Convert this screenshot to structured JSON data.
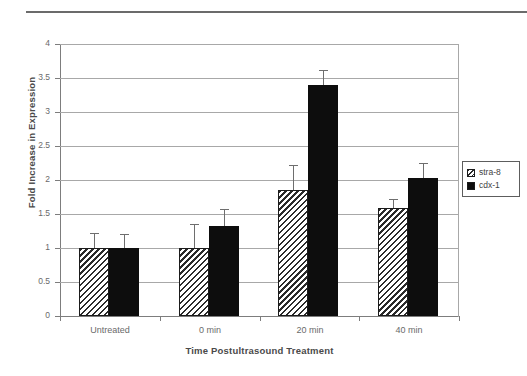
{
  "figure": {
    "has_top_rule": true
  },
  "chart_data": {
    "type": "bar",
    "title": "",
    "xlabel": "Time Postultrasound Treatment",
    "ylabel": "Fold Increase in Expression",
    "categories": [
      "Untreated",
      "0 min",
      "20 min",
      "40 min"
    ],
    "ylim": [
      0,
      4
    ],
    "yticks": [
      0,
      0.5,
      1,
      1.5,
      2,
      2.5,
      3,
      3.5,
      4
    ],
    "ytick_labels": [
      "0",
      "0.5",
      "1",
      "1.5",
      "2",
      "2.5",
      "3",
      "3.5",
      "4"
    ],
    "grid": true,
    "grid_axis": "y",
    "legend_position": "right",
    "series": [
      {
        "name": "stra-8",
        "fill": "hatched",
        "values": [
          1.0,
          1.0,
          1.85,
          1.59
        ],
        "error_upper": [
          0.22,
          0.35,
          0.37,
          0.13
        ]
      },
      {
        "name": "cdx-1",
        "fill": "solid",
        "values": [
          1.0,
          1.33,
          3.4,
          2.03
        ],
        "error_upper": [
          0.21,
          0.24,
          0.22,
          0.22
        ]
      }
    ],
    "colors": {
      "hatch_line": "#2b2b2b",
      "hatch_background": "#ffffff",
      "solid_fill": "#0d0d0d",
      "gridline": "#a8a8a8",
      "axis": "#7d7d7d",
      "error_bar": "#6e6e6e",
      "text": "#4a4a4a"
    }
  }
}
